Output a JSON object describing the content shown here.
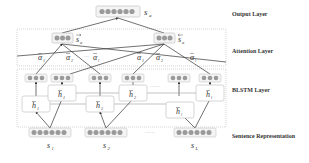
{
  "layers": {
    "output": "Output Layer",
    "attention": "Attention Layer",
    "blstm": "BLSTM Layer",
    "sentence": "Sentence Representation"
  },
  "nodes": {
    "output_vector": "s",
    "output_sub": "a",
    "attn_forward": "s",
    "attn_forward_sub": "a",
    "attn_backward": "s",
    "attn_backward_sub": "a",
    "h_forward": [
      "h",
      "h",
      "h"
    ],
    "h_forward_sub": [
      "1",
      "2",
      "l"
    ],
    "h_backward": [
      "h",
      "h",
      "h"
    ],
    "h_backward_sub": [
      "1",
      "2",
      "l"
    ],
    "sentences": [
      "s",
      "s",
      "s"
    ],
    "sentence_subs": [
      "1",
      "2",
      "L"
    ]
  },
  "attention_weights": {
    "forward": [
      {
        "sym": "α",
        "sub": "1"
      },
      {
        "sym": "α",
        "sub": "2"
      },
      {
        "sym": "α",
        "sub": "l"
      }
    ],
    "backward": [
      {
        "sym": "α",
        "sub": "1"
      },
      {
        "sym": "α",
        "sub": "2"
      },
      {
        "sym": "α",
        "sub": "l"
      }
    ]
  },
  "ellipsis": "······",
  "ellipsis_short": "···",
  "colors": {
    "node_fill": "#9a9a9a",
    "box_stroke": "#bdbdbd",
    "dotted_stroke": "#b0b0b0",
    "line": "#333333",
    "text": "#333333"
  }
}
